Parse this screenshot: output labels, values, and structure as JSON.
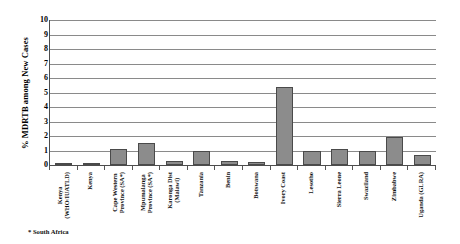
{
  "chart": {
    "ylabel": "% MDRTB among New Cases",
    "footnote": "* South Africa"
  },
  "chart_data": {
    "type": "bar",
    "title": "",
    "xlabel": "",
    "ylabel": "% MDRTB among New Cases",
    "ylim": [
      0,
      10
    ],
    "ytick_labels": [
      "10",
      "9",
      "8",
      "7",
      "6",
      "5",
      "4",
      "3",
      "2",
      "1",
      "0"
    ],
    "grid": true,
    "legend": "none",
    "bar_color": "#8c8c8c",
    "bar_edge_color": "#4a4a4a",
    "annotations": [
      "* South Africa"
    ],
    "categories": [
      "Kenya\n(WHO/IUATLD)",
      "Kenya",
      "Cape Western\nProvince (SA*)",
      "Mpumalanga\nProvince (SA*)",
      "Karonga Dist\n(Malawi)",
      "Tanzania",
      "Benin",
      "Botswana",
      "Ivory Coast",
      "Lesotho",
      "Sierra Leone",
      "Swaziland",
      "Zimbabwe",
      "Uganda (GLRA)"
    ],
    "values": [
      0.0,
      0.1,
      1.1,
      1.5,
      0.3,
      0.95,
      0.3,
      0.2,
      5.4,
      1.0,
      1.1,
      1.0,
      1.9,
      0.7
    ]
  }
}
